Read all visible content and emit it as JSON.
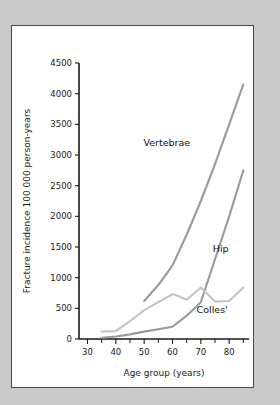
{
  "figure": {
    "background_color": "#c9c9c9",
    "panel_color": "#ffffff",
    "border_color": "#4a4a4a"
  },
  "chart_data": {
    "type": "line",
    "title": "",
    "xlabel": "Age group (years)",
    "ylabel": "Fracture incidence 100 000 person-years",
    "xlim": [
      27,
      87
    ],
    "ylim": [
      0,
      4500
    ],
    "xticks": [
      30,
      35,
      40,
      45,
      50,
      55,
      60,
      65,
      70,
      75,
      80,
      85
    ],
    "xtick_labels": [
      "30",
      "",
      "40",
      "",
      "50",
      "",
      "60",
      "",
      "70",
      "",
      "80",
      ""
    ],
    "yticks": [
      0,
      500,
      1000,
      1500,
      2000,
      2500,
      3000,
      3500,
      4000,
      4500
    ],
    "ytick_labels": [
      "0",
      "500",
      "1000",
      "1500",
      "2000",
      "2500",
      "3000",
      "3500",
      "4000",
      "4500"
    ],
    "grid": false,
    "legend": "inline-annotations",
    "series": [
      {
        "name": "Vertebrae",
        "color": "#9a9a9a",
        "label_x": 58,
        "label_y": 3150,
        "x": [
          50,
          55,
          60,
          65,
          70,
          75,
          80,
          85
        ],
        "values": [
          620,
          880,
          1200,
          1700,
          2250,
          2850,
          3500,
          4150
        ]
      },
      {
        "name": "Hip",
        "color": "#9a9a9a",
        "label_x": 77,
        "label_y": 1420,
        "x": [
          35,
          40,
          45,
          50,
          55,
          60,
          65,
          70,
          75,
          80,
          85
        ],
        "values": [
          20,
          40,
          75,
          120,
          160,
          200,
          380,
          600,
          1300,
          2000,
          2750
        ]
      },
      {
        "name": "Colles'",
        "color": "#c4c4c4",
        "label_x": 74,
        "label_y": 420,
        "x": [
          35,
          40,
          45,
          50,
          55,
          60,
          62,
          65,
          70,
          75,
          80,
          85
        ],
        "values": [
          120,
          130,
          290,
          470,
          600,
          730,
          700,
          640,
          840,
          610,
          620,
          840
        ]
      }
    ]
  },
  "labels": {
    "y_axis_title": "Fracture incidence 100 000 person-years",
    "x_axis_title": "Age group (years)",
    "series_vertebrae": "Vertebrae",
    "series_hip": "Hip",
    "series_colles": "Colles'"
  }
}
